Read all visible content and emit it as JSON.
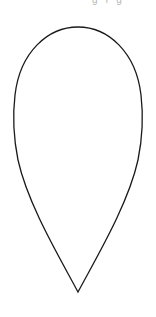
{
  "canvas": {
    "width": 156,
    "height": 317,
    "background": "#ffffff"
  },
  "top_fragment": {
    "text": "ɡ ʏ ɡ"
  },
  "shape": {
    "type": "teardrop-outline",
    "orientation": "point-down",
    "stroke": "#1a1a1a",
    "fill": "#ffffff",
    "stroke_width": 1.3,
    "top": {
      "x": 78,
      "y": 27
    },
    "left_extreme": {
      "x": 14,
      "y": 105
    },
    "right_extreme": {
      "x": 144,
      "y": 105
    },
    "tip": {
      "x": 78,
      "y": 292
    }
  }
}
